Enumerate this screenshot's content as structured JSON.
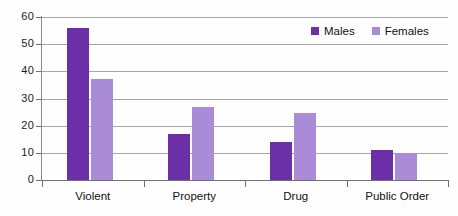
{
  "chart_data": {
    "type": "bar",
    "title": "",
    "subtitle": "",
    "xlabel": "",
    "ylabel": "",
    "categories": [
      "Violent",
      "Property",
      "Drug",
      "Public Order"
    ],
    "series": [
      {
        "name": "Males",
        "color": "#6b2fa8",
        "values": [
          56,
          17,
          14,
          11
        ]
      },
      {
        "name": "Females",
        "color": "#a98bd8",
        "values": [
          37,
          27,
          24.5,
          10
        ]
      }
    ],
    "ylim": [
      0,
      60
    ],
    "ytick_step": 10,
    "yticks": [
      "60",
      "50",
      "40",
      "30",
      "20",
      "10",
      "0"
    ],
    "grid": true,
    "legend_position": "top-right",
    "annotations": []
  },
  "legend": {
    "items": [
      {
        "label": "Males",
        "swatch": "males-swatch"
      },
      {
        "label": "Females",
        "swatch": "females-swatch"
      }
    ]
  },
  "colors": {
    "males": "#6b2fa8",
    "females": "#a98bd8",
    "gridline": "#a8a8a8",
    "axis": "#6f6f6f",
    "text": "#111111",
    "background": "#fefefe"
  }
}
